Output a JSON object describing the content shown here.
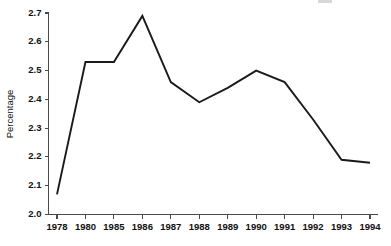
{
  "chart_data": {
    "type": "line",
    "title": "",
    "xlabel": "",
    "ylabel": "Percentage",
    "categories": [
      "1978",
      "1980",
      "1985",
      "1986",
      "1987",
      "1988",
      "1989",
      "1990",
      "1991",
      "1992",
      "1993",
      "1994"
    ],
    "series": [
      {
        "name": "Percentage",
        "values": [
          2.07,
          2.53,
          2.53,
          2.69,
          2.46,
          2.39,
          2.44,
          2.5,
          2.46,
          2.33,
          2.19,
          2.18
        ]
      }
    ],
    "ylim": [
      2.0,
      2.7
    ],
    "ytick_labels": [
      "2.0",
      "2.1",
      "2.2",
      "2.3",
      "2.4",
      "2.5",
      "2.6",
      "2.7"
    ],
    "ytick_values": [
      2.0,
      2.1,
      2.2,
      2.3,
      2.4,
      2.5,
      2.6,
      2.7
    ],
    "grid": false,
    "legend": false,
    "legend_position": "none",
    "line_color": "#1a1a1a",
    "axis_color": "#4a4a4a",
    "background_color": "#ffffff"
  }
}
